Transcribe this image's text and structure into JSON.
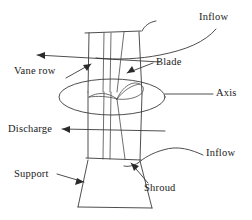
{
  "figure": {
    "background_color": "#ffffff",
    "line_color": "#3a3a3a",
    "text_color": "#1a1a1a"
  },
  "labels": {
    "inflow_top": "Inflow",
    "inflow_bottom": "Inflow",
    "blade": "Blade",
    "axis": "Axis",
    "vane_row": "Vane row",
    "discharge": "Discharge",
    "support": "Support",
    "shroud": "Shroud"
  },
  "callouts": [
    {
      "name": "inflow-top",
      "label": "Inflow",
      "marker": "curved-swirl-line"
    },
    {
      "name": "blade",
      "label": "Blade",
      "marker": "arrow-down-left"
    },
    {
      "name": "axis",
      "label": "Axis",
      "marker": "horizontal-leader-line"
    },
    {
      "name": "vane-row",
      "label": "Vane row",
      "marker": "arrow-up-right"
    },
    {
      "name": "discharge",
      "label": "Discharge",
      "marker": "arrow-left"
    },
    {
      "name": "inflow-bottom",
      "label": "Inflow",
      "marker": "curved-swirl-line"
    },
    {
      "name": "support",
      "label": "Support",
      "marker": "arrow-right"
    },
    {
      "name": "shroud",
      "label": "Shroud",
      "marker": "arrow-up-left"
    }
  ],
  "components": [
    {
      "name": "duct-shroud",
      "shape": "vertical-cylindrical-duct"
    },
    {
      "name": "rotor-disc",
      "shape": "ellipse"
    },
    {
      "name": "blade-left",
      "shape": "crescent-airfoil"
    },
    {
      "name": "blade-right",
      "shape": "pointed-leaf-airfoil"
    },
    {
      "name": "vane-row-lines",
      "shape": "vertical-lines"
    },
    {
      "name": "support-base",
      "shape": "flared-trapezoid"
    }
  ]
}
